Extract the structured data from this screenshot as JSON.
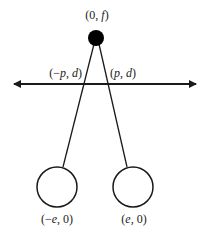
{
  "diagram": {
    "colors": {
      "stroke": "#1a1a1a",
      "dot": "#000000",
      "background": "#ffffff"
    },
    "top_point": {
      "label_open": "(0, ",
      "label_var": "f",
      "label_close": ")"
    },
    "left_cross": {
      "label_open": "(−",
      "label_var1": "p",
      "label_sep": ", ",
      "label_var2": "d",
      "label_close": ")"
    },
    "right_cross": {
      "label_open": "(",
      "label_var1": "p",
      "label_sep": ", ",
      "label_var2": "d",
      "label_close": ")"
    },
    "left_circle": {
      "label_open": "(−",
      "label_var": "e",
      "label_close": ", 0)"
    },
    "right_circle": {
      "label_open": "(",
      "label_var": "e",
      "label_close": ", 0)"
    },
    "axis": {
      "arrows": "both-ends"
    }
  }
}
